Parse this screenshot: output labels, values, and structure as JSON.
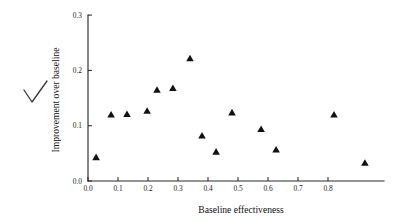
{
  "chart_data": {
    "type": "scatter",
    "title": "",
    "xlabel": "Baseline effectiveness",
    "ylabel": "Improvement over baseline",
    "xlim": [
      0.0,
      0.95
    ],
    "ylim": [
      0.0,
      0.3
    ],
    "xticks": [
      "0.0",
      "0.1",
      "0.2",
      "0.3",
      "0.4",
      "0.5",
      "0.6",
      "0.7",
      "0.8"
    ],
    "xtick_values": [
      0.0,
      0.1,
      0.2,
      0.3,
      0.4,
      0.5,
      0.6,
      0.7,
      0.8
    ],
    "yticks": [
      "0.0",
      "0.1",
      "0.2",
      "0.3"
    ],
    "ytick_values": [
      0.0,
      0.1,
      0.2,
      0.3
    ],
    "grid": false,
    "legend": false,
    "marker": "triangle",
    "marker_color": "#111111",
    "points": [
      {
        "x": 0.027,
        "y": 0.043
      },
      {
        "x": 0.077,
        "y": 0.12
      },
      {
        "x": 0.13,
        "y": 0.121
      },
      {
        "x": 0.197,
        "y": 0.127
      },
      {
        "x": 0.23,
        "y": 0.165
      },
      {
        "x": 0.283,
        "y": 0.168
      },
      {
        "x": 0.34,
        "y": 0.222
      },
      {
        "x": 0.38,
        "y": 0.082
      },
      {
        "x": 0.427,
        "y": 0.053
      },
      {
        "x": 0.48,
        "y": 0.124
      },
      {
        "x": 0.577,
        "y": 0.094
      },
      {
        "x": 0.627,
        "y": 0.057
      },
      {
        "x": 0.82,
        "y": 0.12
      },
      {
        "x": 0.923,
        "y": 0.033
      }
    ]
  },
  "annotations": {
    "checkmark": {
      "name": "checkmark",
      "glyph": "check"
    }
  }
}
